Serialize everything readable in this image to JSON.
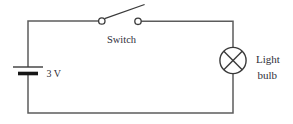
{
  "diagram": {
    "type": "circuit-schematic",
    "background_color": "#ffffff",
    "wire_color": "#5c5c5c",
    "symbol_color": "#3a3a3a",
    "text_color": "#2e2e38",
    "battery_plate_color": "#161616",
    "components": {
      "battery": {
        "kind": "cell",
        "label": "3 V"
      },
      "switch": {
        "kind": "switch",
        "state": "open",
        "label": "Switch"
      },
      "bulb": {
        "kind": "lamp",
        "label_line1": "Light",
        "label_line2": "bulb"
      }
    }
  }
}
